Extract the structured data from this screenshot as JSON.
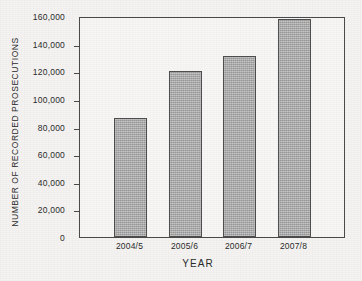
{
  "chart_data": {
    "type": "bar",
    "title": "",
    "xlabel": "YEAR",
    "ylabel": "NUMBER OF RECORDED PROSECUTIONS",
    "categories": [
      "2004/5",
      "2005/6",
      "2006/7",
      "2007/8"
    ],
    "values": [
      86500,
      120500,
      131000,
      157500
    ],
    "series": [
      {
        "name": "Number of recorded prosecutions",
        "values": [
          86500,
          120500,
          131000,
          157500
        ]
      }
    ],
    "ylim": [
      0,
      160000
    ],
    "ytick_values": [
      0,
      20000,
      40000,
      60000,
      80000,
      100000,
      120000,
      140000,
      160000
    ],
    "ytick_labels": [
      "0",
      "20,000",
      "40,000",
      "60,000",
      "80,000",
      "100,000",
      "120,000",
      "140,000",
      "160,000"
    ],
    "grid": false,
    "legend": false,
    "legend_position": "none",
    "bar_color": "#a9a9a9",
    "bar_edge_color": "#4f4f4f",
    "frame_color": "#4a4a4a",
    "background_color": "#f4f3f1"
  }
}
